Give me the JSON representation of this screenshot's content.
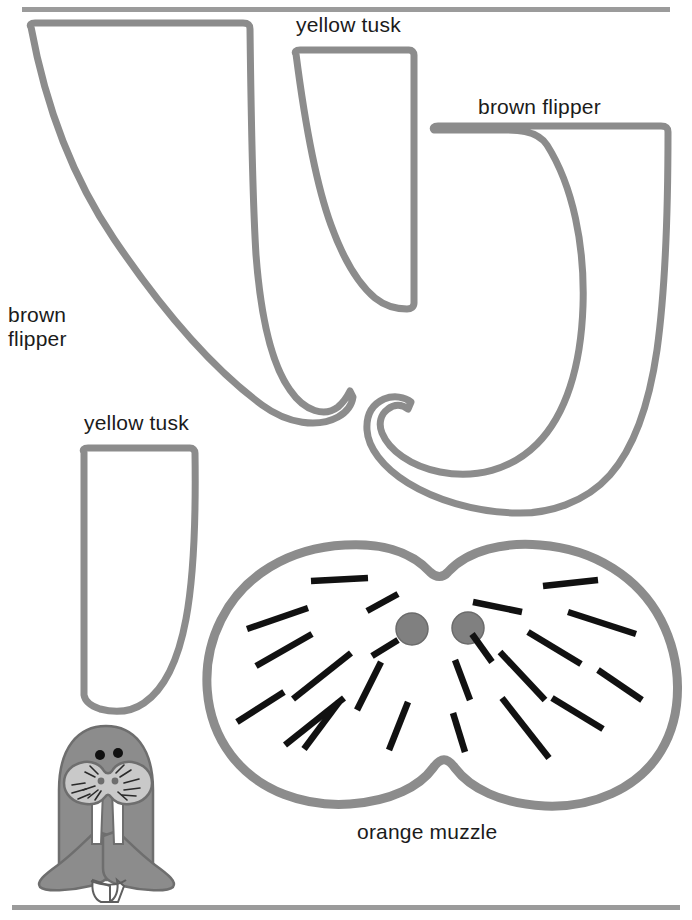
{
  "page": {
    "type": "cut-out pattern sheet",
    "width": 692,
    "height": 920,
    "background_color": "#ffffff",
    "rule_color": "#9b9b9b",
    "outline_color": "#8c8c8c",
    "ink_color": "#1b1b1b"
  },
  "rules": {
    "top_rule_name": "top-divider",
    "bottom_rule_name": "bottom-divider"
  },
  "labels": {
    "tusk_top": "yellow tusk",
    "flipper_right": "brown flipper",
    "flipper_left": "brown\nflipper",
    "tusk_bottom": "yellow tusk",
    "muzzle": "orange muzzle"
  },
  "pieces": [
    {
      "id": "flipper-left",
      "label": "brown flipper",
      "color_word": "brown",
      "part": "flipper",
      "count": 1,
      "outline_color": "#8c8c8c",
      "fill": "#ffffff"
    },
    {
      "id": "tusk-top",
      "label": "yellow tusk",
      "color_word": "yellow",
      "part": "tusk",
      "count": 1,
      "outline_color": "#8c8c8c",
      "fill": "#ffffff"
    },
    {
      "id": "flipper-right",
      "label": "brown flipper",
      "color_word": "brown",
      "part": "flipper",
      "count": 1,
      "outline_color": "#8c8c8c",
      "fill": "#ffffff"
    },
    {
      "id": "tusk-bottom",
      "label": "yellow tusk",
      "color_word": "yellow",
      "part": "tusk",
      "count": 1,
      "outline_color": "#8c8c8c",
      "fill": "#ffffff"
    },
    {
      "id": "muzzle",
      "label": "orange muzzle",
      "color_word": "orange",
      "part": "muzzle",
      "count": 1,
      "outline_color": "#8c8c8c",
      "fill": "#ffffff",
      "nostril_color": "#808080",
      "nostril_count": 2,
      "whisker_color": "#111111",
      "whisker_count": 22
    }
  ],
  "mini_walrus": {
    "name": "assembled walrus preview",
    "body_color": "#8c8c8c",
    "muzzle_color": "#c9c9c9",
    "tusk_color": "#ffffff",
    "eye_color": "#111111",
    "eye_count": 2,
    "nostril_count": 2,
    "flipper_count": 2,
    "feet_count": 2
  }
}
